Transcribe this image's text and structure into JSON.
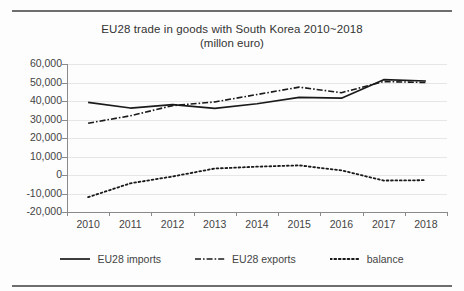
{
  "page": {
    "top_rule": "horizontal-rule",
    "bottom_rule": "horizontal-rule"
  },
  "chart_data": {
    "type": "line",
    "title": "EU28 trade in goods with South Korea 2010~2018",
    "subtitle": "(millon euro)",
    "xlabel": "",
    "ylabel": "",
    "unit": "million euro",
    "grid": true,
    "legend_position": "bottom",
    "ylim": [
      -20000,
      60000
    ],
    "ytick_step": 10000,
    "yticks": [
      60000,
      50000,
      40000,
      30000,
      20000,
      10000,
      0,
      -10000,
      -20000
    ],
    "ytick_labels": [
      "60,000",
      "50,000",
      "40,000",
      "30,000",
      "20,000",
      "10,000",
      "0",
      "-10,000",
      "-20,000"
    ],
    "categories": [
      2010,
      2011,
      2012,
      2013,
      2014,
      2015,
      2016,
      2017,
      2018
    ],
    "category_labels": [
      "2010",
      "2011",
      "2012",
      "2013",
      "2014",
      "2015",
      "2016",
      "2017",
      "2018"
    ],
    "series": [
      {
        "name": "EU28 imports",
        "style": "solid",
        "color": "#1a1a1a",
        "values": [
          39300,
          36200,
          38000,
          36000,
          38500,
          42000,
          41500,
          51500,
          50800
        ]
      },
      {
        "name": "EU28 exports",
        "style": "dash-dot",
        "color": "#1a1a1a",
        "values": [
          28000,
          32000,
          37500,
          39500,
          43500,
          47500,
          44500,
          50500,
          50000
        ]
      },
      {
        "name": "balance",
        "style": "dotted",
        "color": "#1a1a1a",
        "values": [
          -12000,
          -4500,
          -800,
          3500,
          4500,
          5200,
          2500,
          -3000,
          -2800
        ]
      }
    ]
  },
  "legend": {
    "items": [
      {
        "label": "EU28 imports",
        "swatch": "solid-line-swatch"
      },
      {
        "label": "EU28 exports",
        "swatch": "dash-dot-line-swatch"
      },
      {
        "label": "balance",
        "swatch": "dotted-line-swatch"
      }
    ]
  }
}
